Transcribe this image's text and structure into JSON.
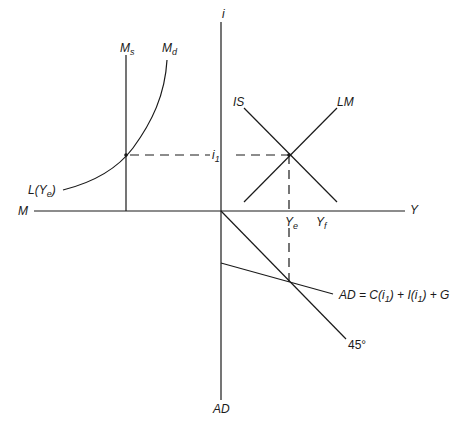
{
  "diagram": {
    "type": "IS-LM / money market / aggregate demand four-quadrant diagram",
    "axes": {
      "vertical_top": "i",
      "vertical_bottom": "AD",
      "horizontal_left": "M",
      "horizontal_right": "Y"
    },
    "curves": {
      "money_supply": {
        "label": "M",
        "sub": "s"
      },
      "money_demand": {
        "label": "M",
        "sub": "d"
      },
      "liquidity": {
        "label": "L(Y",
        "sub": "e",
        "close": ")"
      },
      "is": "IS",
      "lm": "LM",
      "ad": {
        "prefix": "AD = C(i",
        "sub1": "1",
        "mid": ") + I(i",
        "sub2": "1",
        "suffix": ") + G"
      },
      "forty_five": "45°"
    },
    "points": {
      "interest_rate": {
        "label": "i",
        "sub": "1"
      },
      "equilibrium_income": {
        "label": "Y",
        "sub": "e"
      },
      "full_employment_income": {
        "label": "Y",
        "sub": "f"
      }
    },
    "colors": {
      "line": "#1a1a1a",
      "background": "#ffffff"
    }
  }
}
